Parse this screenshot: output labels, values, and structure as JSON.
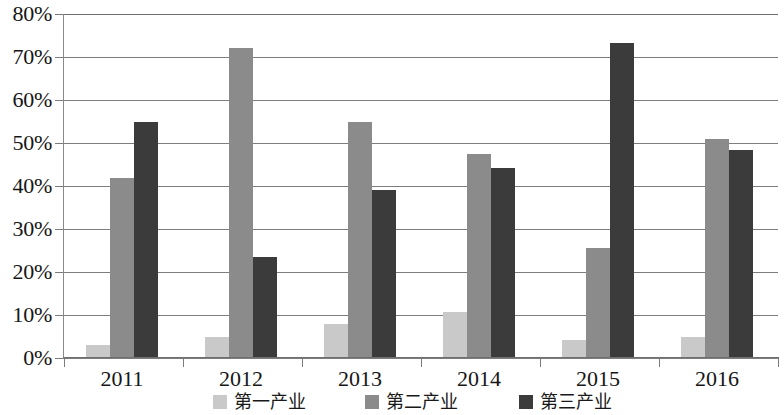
{
  "chart_data": {
    "type": "bar",
    "title": "",
    "subtitle": "",
    "xlabel": "",
    "ylabel": "",
    "categories": [
      "2011",
      "2012",
      "2013",
      "2014",
      "2015",
      "2016"
    ],
    "series": [
      {
        "name": "第一产业",
        "color": "#c9c9c9",
        "values": [
          3.0,
          5.0,
          8.0,
          10.8,
          4.3,
          4.8
        ]
      },
      {
        "name": "第二产业",
        "color": "#8b8b8b",
        "values": [
          41.8,
          72.2,
          55.0,
          47.5,
          25.5,
          51.0
        ]
      },
      {
        "name": "第三产业",
        "color": "#3b3b3b",
        "values": [
          55.0,
          23.4,
          39.0,
          44.2,
          73.2,
          48.4
        ]
      }
    ],
    "ylim": [
      0,
      80
    ],
    "ytick_values": [
      0,
      10,
      20,
      30,
      40,
      50,
      60,
      70,
      80
    ],
    "ytick_labels": [
      "0%",
      "10%",
      "20%",
      "30%",
      "40%",
      "50%",
      "60%",
      "70%",
      "80%"
    ],
    "grid": true,
    "grid_axis": "y",
    "legend_position": "bottom",
    "value_format": "percent"
  },
  "legend": {
    "items": [
      {
        "label": "第一产业",
        "color": "#c9c9c9"
      },
      {
        "label": "第二产业",
        "color": "#8b8b8b"
      },
      {
        "label": "第三产业",
        "color": "#3b3b3b"
      }
    ]
  },
  "colors": {
    "series_1": "#c9c9c9",
    "series_2": "#8b8b8b",
    "series_3": "#3b3b3b",
    "gridline": "#7d7d7d",
    "axis": "#6f6f6f",
    "text": "#161616",
    "background": "#ffffff"
  }
}
